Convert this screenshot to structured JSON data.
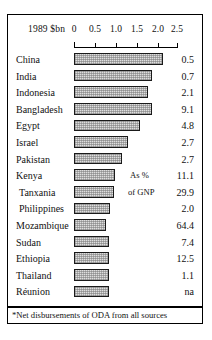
{
  "chart_data": {
    "type": "bar",
    "title": "",
    "unit_label": "1989 $bn",
    "xlabel": "",
    "ylabel": "",
    "xlim": [
      0,
      2.5
    ],
    "grid": false,
    "orientation": "horizontal",
    "tick_labels": [
      "0",
      "0.5",
      "1.0",
      "1.5",
      "2.0",
      "2.5"
    ],
    "tick_values": [
      0,
      0.5,
      1.0,
      1.5,
      2.0,
      2.5
    ],
    "value_column_header": "",
    "categories": [
      "China",
      "India",
      "Indonesia",
      "Bangladesh",
      "Egypt",
      "Israel",
      "Pakistan",
      "Kenya",
      "Tanxania",
      "Philippines",
      "Mozambique",
      "Sudan",
      "Ethiopia",
      "Thailand",
      "Réunion"
    ],
    "values": [
      2.15,
      1.9,
      1.8,
      1.9,
      1.6,
      1.3,
      1.17,
      1.0,
      0.97,
      0.87,
      0.78,
      0.84,
      0.84,
      0.84,
      0.84
    ],
    "value_labels": [
      "0.5",
      "0.7",
      "2.1",
      "9.1",
      "4.8",
      "2.7",
      "2.7",
      "11.1",
      "29.9",
      "2.0",
      "64.4",
      "7.4",
      "12.5",
      "1.1",
      "na"
    ],
    "annotations": [
      "As %",
      "of GNP"
    ],
    "footnote": "*Net disbursements of ODA from all sources",
    "colors": {
      "bar_fill": "#dedede",
      "bar_border": "#1a1a1a",
      "frame": "#000000",
      "text": "#111111"
    }
  }
}
